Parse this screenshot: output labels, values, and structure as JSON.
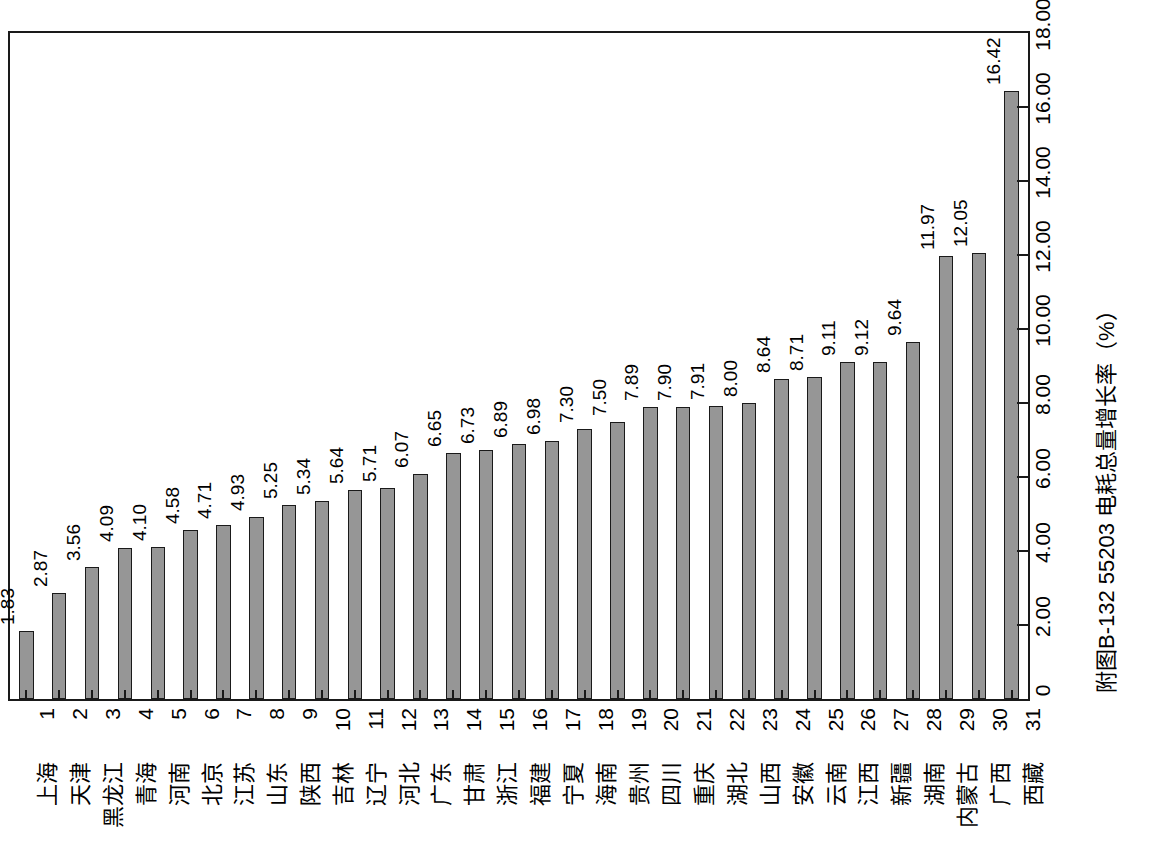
{
  "chart_data": {
    "type": "bar",
    "title": "附图B-132  55203 电耗总量增长率（%）",
    "orientation": "vertical-bars-rotated-figure",
    "xlabel": "",
    "ylabel": "附图B-132  55203 电耗总量增长率（%）",
    "ylim": [
      0,
      18
    ],
    "grid": false,
    "legend": null,
    "axis_tick_labels": [
      "0",
      "2.00",
      "4.00",
      "6.00",
      "8.00",
      "10.00",
      "12.00",
      "14.00",
      "16.00",
      "18.00"
    ],
    "axis_tick_values": [
      0,
      2,
      4,
      6,
      8,
      10,
      12,
      14,
      16,
      18
    ],
    "indices": [
      "1",
      "2",
      "3",
      "4",
      "5",
      "6",
      "7",
      "8",
      "9",
      "10",
      "11",
      "12",
      "13",
      "14",
      "15",
      "16",
      "17",
      "18",
      "19",
      "20",
      "21",
      "22",
      "23",
      "24",
      "25",
      "26",
      "27",
      "28",
      "29",
      "30",
      "31"
    ],
    "categories": [
      "上海",
      "天津",
      "黑龙江",
      "青海",
      "河南",
      "北京",
      "江苏",
      "山东",
      "陕西",
      "吉林",
      "辽宁",
      "河北",
      "广东",
      "甘肃",
      "浙江",
      "福建",
      "宁夏",
      "海南",
      "贵州",
      "四川",
      "重庆",
      "湖北",
      "山西",
      "安徽",
      "云南",
      "江西",
      "新疆",
      "湖南",
      "内蒙古",
      "广西",
      "西藏"
    ],
    "values": [
      1.83,
      2.87,
      3.56,
      4.09,
      4.1,
      4.58,
      4.71,
      4.93,
      5.25,
      5.34,
      5.64,
      5.71,
      6.07,
      6.65,
      6.73,
      6.89,
      6.98,
      7.3,
      7.5,
      7.89,
      7.9,
      7.91,
      8.0,
      8.64,
      8.71,
      9.11,
      9.12,
      9.64,
      11.97,
      12.05,
      16.42
    ],
    "value_labels": [
      "1.83",
      "2.87",
      "3.56",
      "4.09",
      "4.10",
      "4.58",
      "4.71",
      "4.93",
      "5.25",
      "5.34",
      "5.64",
      "5.71",
      "6.07",
      "6.65",
      "6.73",
      "6.89",
      "6.98",
      "7.30",
      "7.50",
      "7.89",
      "7.90",
      "7.91",
      "8.00",
      "8.64",
      "8.71",
      "9.11",
      "9.12",
      "9.64",
      "11.97",
      "12.05",
      "16.42"
    ]
  },
  "style": {
    "bar_fill": "#969696",
    "bar_border": "#1a1a1a",
    "frame_color": "#1a1a1a",
    "background": "#ffffff",
    "text_color": "#000000"
  }
}
